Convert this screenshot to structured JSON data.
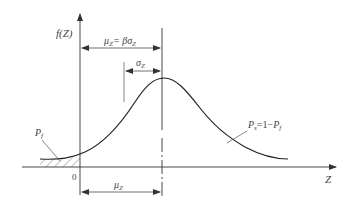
{
  "diagram": {
    "type": "probability-density-curve",
    "y_axis_label": "f(Z)",
    "x_axis_label": "Z",
    "origin_label": "0",
    "labels": {
      "mean_equals_beta_sigma": "μZ= βσZ",
      "sigma": "σZ",
      "mean": "μZ",
      "failure_prob": "Pf",
      "safety_prob": "Ps=1−Pf"
    },
    "parts": {
      "mu": "μ",
      "Z": "Z",
      "eq": "= βσ",
      "sigma": "σ",
      "P": "P",
      "f": "f",
      "s": "s",
      "one_minus": "=1−"
    },
    "colors": {
      "line": "#333333",
      "text": "#444444",
      "background": "#ffffff"
    }
  }
}
